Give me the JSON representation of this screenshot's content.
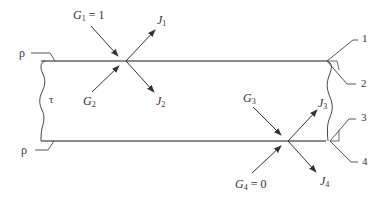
{
  "diagram": {
    "type": "radiation-exchange-slab",
    "colors": {
      "line": "#555555",
      "text": "#333333",
      "background": "#ffffff"
    },
    "left_labels": {
      "top_rho": "ρ",
      "bottom_rho": "ρ",
      "tau": "τ"
    },
    "surface_labels": [
      "1",
      "2",
      "3",
      "4"
    ],
    "top_interface": {
      "incident_outside": {
        "symbol": "G",
        "sub": "1",
        "suffix": " = 1"
      },
      "incident_inside": {
        "symbol": "G",
        "sub": "2",
        "suffix": ""
      },
      "leaving_outside": {
        "symbol": "J",
        "sub": "1"
      },
      "leaving_inside": {
        "symbol": "J",
        "sub": "2"
      }
    },
    "bottom_interface": {
      "incident_inside": {
        "symbol": "G",
        "sub": "3",
        "suffix": ""
      },
      "incident_outside": {
        "symbol": "G",
        "sub": "4",
        "suffix": " = 0"
      },
      "leaving_inside": {
        "symbol": "J",
        "sub": "3"
      },
      "leaving_outside": {
        "symbol": "J",
        "sub": "4"
      }
    }
  }
}
